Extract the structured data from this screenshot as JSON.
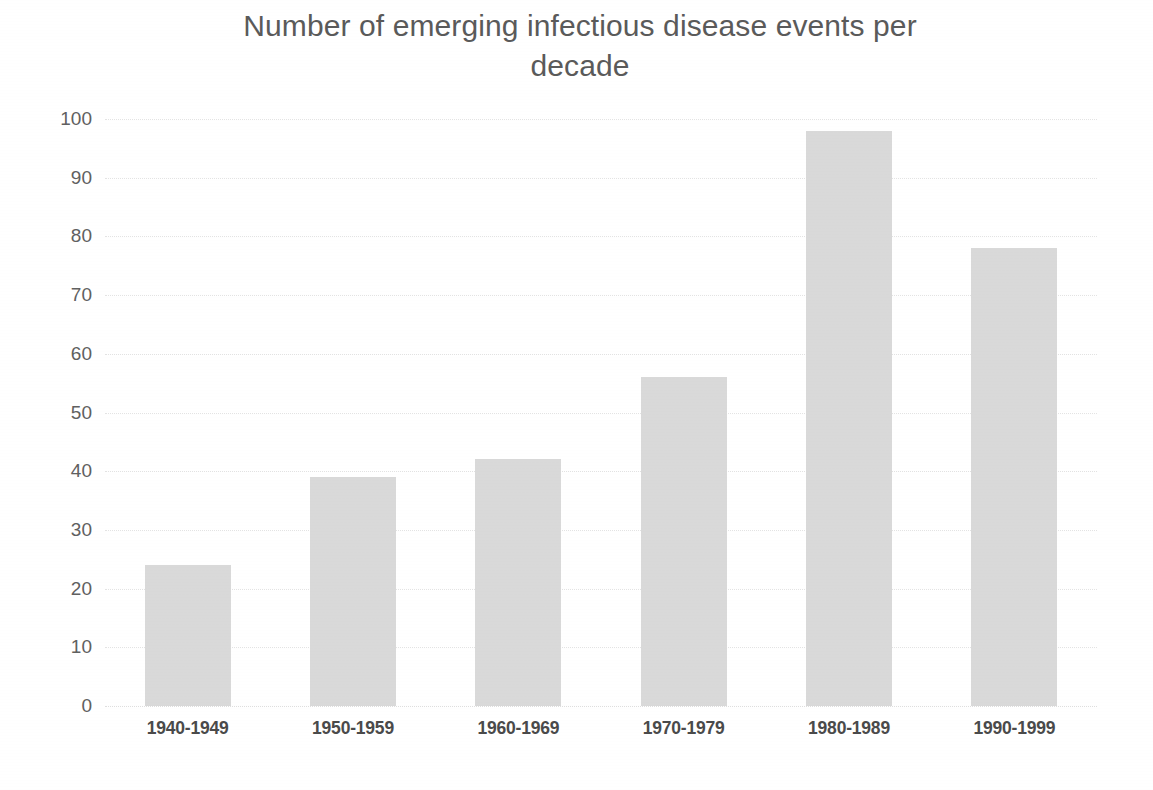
{
  "chart_data": {
    "type": "bar",
    "title": "Number of emerging infectious disease events per decade",
    "title_line1": "Number of emerging infectious disease events per",
    "title_line2": "decade",
    "xlabel": "",
    "ylabel": "",
    "categories": [
      "1940-1949",
      "1950-1959",
      "1960-1969",
      "1970-1979",
      "1980-1989",
      "1990-1999"
    ],
    "values": [
      24,
      39,
      42,
      56,
      98,
      78
    ],
    "ylim": [
      0,
      100
    ],
    "ytick_step": 10,
    "yticks": [
      100,
      90,
      80,
      70,
      60,
      50,
      40,
      30,
      20,
      10,
      0
    ],
    "ytick_labels": [
      "100",
      "90",
      "80",
      "70",
      "60",
      "50",
      "40",
      "30",
      "20",
      "10",
      "0"
    ],
    "grid": true,
    "grid_axis": "y",
    "legend": false,
    "legend_position": "none",
    "series": [
      {
        "name": "Emerging infectious disease events",
        "values": [
          24,
          39,
          42,
          56,
          98,
          78
        ]
      }
    ],
    "colors": {
      "bar_fill": "#d9d9d9",
      "gridline": "#e3e3e3",
      "title_text": "#5a5a5a",
      "tick_text": "#4a4a4a",
      "background": "#ffffff"
    }
  }
}
